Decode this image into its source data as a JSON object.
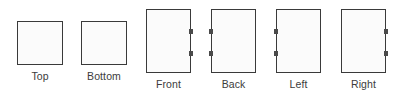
{
  "diagram": {
    "type": "orthographic-panel-layout",
    "background_color": "#ffffff",
    "outline_color": "#3a3a3a",
    "fill_color": "#fbfbfb",
    "tab_color": "#4a4a4a",
    "label_color": "#3c3c3c",
    "panels": [
      {
        "id": "top",
        "label": "Top",
        "shape": "square",
        "tab_edge": "none",
        "tab_count": 0,
        "x": 17,
        "y": 21,
        "width": 46,
        "height": 44
      },
      {
        "id": "bottom",
        "label": "Bottom",
        "shape": "square",
        "tab_edge": "none",
        "tab_count": 0,
        "x": 81,
        "y": 21,
        "width": 46,
        "height": 44
      },
      {
        "id": "front",
        "label": "Front",
        "shape": "tall",
        "tab_edge": "right",
        "tab_count": 2,
        "x": 146,
        "y": 9,
        "width": 45,
        "height": 64
      },
      {
        "id": "back",
        "label": "Back",
        "shape": "tall",
        "tab_edge": "left",
        "tab_count": 2,
        "x": 211,
        "y": 9,
        "width": 45,
        "height": 64
      },
      {
        "id": "left",
        "label": "Left",
        "shape": "tall",
        "tab_edge": "left",
        "tab_count": 2,
        "x": 276,
        "y": 9,
        "width": 45,
        "height": 64
      },
      {
        "id": "right",
        "label": "Right",
        "shape": "tall",
        "tab_edge": "right",
        "tab_count": 2,
        "x": 341,
        "y": 9,
        "width": 45,
        "height": 64
      }
    ]
  }
}
